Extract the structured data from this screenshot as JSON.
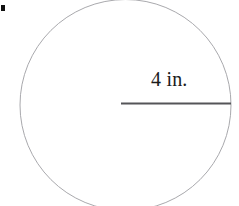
{
  "figure": {
    "type": "circle-with-radius",
    "background_color": "#ffffff",
    "bullet_marker": {
      "name": "list-bullet",
      "color": "#111111",
      "x": 1,
      "y": 5,
      "width": 4,
      "height": 6
    },
    "circle": {
      "center_x": 125.5,
      "center_y": 105,
      "radius": 105.5,
      "stroke_color": "#a9a9ad",
      "stroke_width": 1,
      "fill": "none",
      "clipped_at_bottom": true
    },
    "radius_segment": {
      "x1": 121,
      "y1": 103.5,
      "x2": 231,
      "y2": 103.5,
      "stroke_color": "#555558",
      "stroke_width": 1.8
    },
    "label": {
      "text": "4 in.",
      "value": 4,
      "unit": "in.",
      "color": "#1b1b1b",
      "font_size": 20,
      "x": 151,
      "y": 69
    }
  }
}
